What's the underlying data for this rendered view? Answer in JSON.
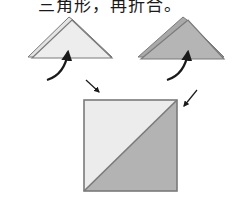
{
  "caption": {
    "text": "三角形，再折合。"
  },
  "colors": {
    "light_fill": "#ececec",
    "dark_fill": "#b3b3b3",
    "outline": "#7a7a7a",
    "arrow": "#1a1a1a",
    "background": "#ffffff"
  },
  "diagram": {
    "steps": [
      {
        "label": "light-triangle",
        "description": "Light triangle folded, arrow curving up"
      },
      {
        "label": "dark-triangle",
        "description": "Dark triangle folded, arrow curving up"
      },
      {
        "label": "square-result",
        "description": "Square split diagonally: light upper-left, dark lower-right, arrows pointing to top corners"
      }
    ]
  }
}
